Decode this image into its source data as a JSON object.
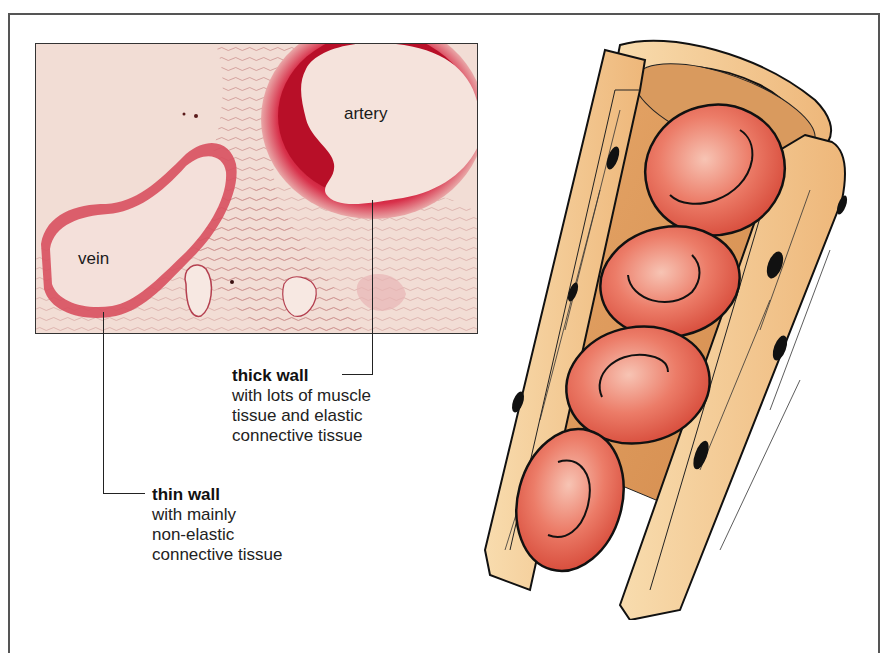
{
  "micrograph": {
    "labels": {
      "artery": "artery",
      "vein": "vein"
    }
  },
  "annotations": {
    "artery_wall": {
      "title": "thick wall",
      "lines": [
        "with lots of muscle",
        "tissue and elastic",
        "connective tissue"
      ]
    },
    "vein_wall": {
      "title": "thin wall",
      "lines": [
        "with mainly",
        "non-elastic",
        "connective tissue"
      ]
    }
  },
  "illustration": {
    "subject": "capillary with red blood cells",
    "red_blood_cell_count": 4
  },
  "colors": {
    "artery_wall": "#c8152e",
    "tissue_background": "#f3ddd6",
    "vessel_wall": "#f5cf98",
    "red_blood_cell": "#e9705e",
    "nucleus": "#111111"
  }
}
